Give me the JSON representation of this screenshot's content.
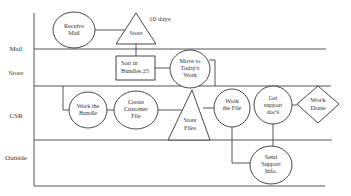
{
  "lanes": [
    {
      "label": "Mail"
    },
    {
      "label": "Store"
    },
    {
      "label": "CSR"
    },
    {
      "label": "Outside"
    }
  ],
  "nodes": {
    "receive_mail": {
      "lines": [
        "Receive",
        "Mail"
      ]
    },
    "store": {
      "lines": [
        "Store"
      ]
    },
    "store_note": "10 days",
    "sort_bundles": {
      "lines": [
        "Sort in",
        "Bundles 25"
      ]
    },
    "move_today": {
      "lines": [
        "Move to",
        "Today's",
        "Work"
      ]
    },
    "work_bundle": {
      "lines": [
        "Work the",
        "Bundle"
      ]
    },
    "create_file": {
      "lines": [
        "Create",
        "Customer",
        "File"
      ]
    },
    "store_files": {
      "lines": [
        "Store",
        "Files"
      ]
    },
    "work_file": {
      "lines": [
        "Work",
        "the File"
      ]
    },
    "get_docs": {
      "lines": [
        "Get",
        "support",
        "doc's"
      ]
    },
    "work_done": {
      "lines": [
        "Work",
        "Done"
      ]
    },
    "send_info": {
      "lines": [
        "Send",
        "Support",
        "Info."
      ]
    }
  }
}
